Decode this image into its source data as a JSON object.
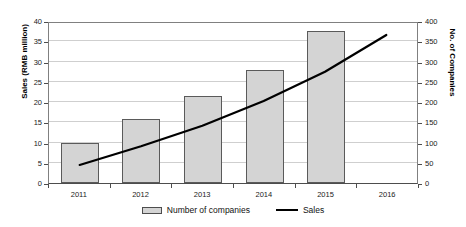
{
  "chart_data": {
    "type": "bar",
    "title": "",
    "subtitle": "",
    "xlabel": "",
    "categories": [
      "2011",
      "2012",
      "2013",
      "2014",
      "2015",
      "2016"
    ],
    "grid": true,
    "legend_position": "bottom",
    "axes": {
      "left": {
        "label": "Sales (RMB million)",
        "min": 0,
        "max": 40,
        "step": 5,
        "ticks": [
          "0",
          "5",
          "10",
          "15",
          "20",
          "25",
          "30",
          "35",
          "40"
        ]
      },
      "right": {
        "label": "No. of Companies",
        "min": 0,
        "max": 400,
        "step": 50,
        "ticks": [
          "0",
          "50",
          "100",
          "150",
          "200",
          "250",
          "300",
          "350",
          "400"
        ]
      }
    },
    "series": [
      {
        "name": "Number of companies",
        "type": "bar",
        "axis": "right",
        "color": "#d4d4d4",
        "border_color": "#5a5a5a",
        "values": [
          100,
          158,
          215,
          278,
          375,
          null
        ]
      },
      {
        "name": "Sales",
        "type": "line",
        "axis": "left",
        "color": "#000000",
        "values": [
          4.5,
          9.2,
          14.3,
          20.5,
          27.8,
          37.0
        ]
      }
    ]
  },
  "legend": {
    "items": [
      {
        "label": "Number of companies",
        "marker": "bar-swatch"
      },
      {
        "label": "Sales",
        "marker": "line-swatch"
      }
    ]
  }
}
